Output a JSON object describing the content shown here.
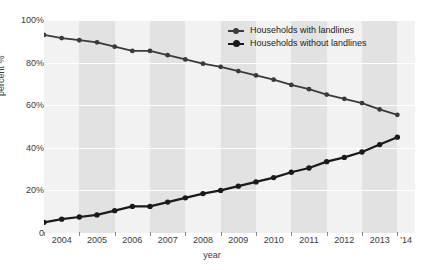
{
  "chart_data": {
    "type": "line",
    "title": "",
    "xlabel": "year",
    "ylabel": "percent %",
    "ylim": [
      0,
      100
    ],
    "xlim": [
      2004.0,
      2014.5
    ],
    "grid": true,
    "legend_position": "top-right",
    "y_ticks": [
      "0",
      "20%",
      "40%",
      "60%",
      "80%",
      "100%"
    ],
    "y_tick_values": [
      0,
      20,
      40,
      60,
      80,
      100
    ],
    "x_ticks": [
      "2004",
      "2005",
      "2006",
      "2007",
      "2008",
      "2009",
      "2010",
      "2011",
      "2012",
      "2013",
      "'14"
    ],
    "x_tick_values": [
      2004,
      2005,
      2006,
      2007,
      2008,
      2009,
      2010,
      2011,
      2012,
      2013,
      2014
    ],
    "x": [
      2004.0,
      2004.5,
      2005.0,
      2005.5,
      2006.0,
      2006.5,
      2007.0,
      2007.5,
      2008.0,
      2008.5,
      2009.0,
      2009.5,
      2010.0,
      2010.5,
      2011.0,
      2011.5,
      2012.0,
      2012.5,
      2013.0,
      2013.5,
      2014.0
    ],
    "series": [
      {
        "name": "Households with landlines",
        "color": "#3a3a3a",
        "values": [
          93.0,
          91.5,
          90.5,
          89.5,
          87.5,
          85.5,
          85.5,
          83.5,
          81.5,
          79.5,
          78.0,
          76.0,
          74.0,
          72.0,
          69.5,
          67.5,
          65.0,
          63.0,
          61.0,
          58.0,
          55.5
        ]
      },
      {
        "name": "Households without landlines",
        "color": "#1a1a1a",
        "values": [
          5.0,
          6.5,
          7.5,
          8.5,
          10.5,
          12.5,
          12.5,
          14.5,
          16.5,
          18.5,
          20.0,
          22.0,
          24.0,
          26.0,
          28.5,
          30.5,
          33.5,
          35.5,
          38.0,
          41.5,
          45.0
        ]
      }
    ]
  },
  "legend": {
    "items": [
      {
        "label": "Households with landlines"
      },
      {
        "label": "Households without landlines"
      }
    ]
  },
  "axes": {
    "y_title": "percent %",
    "x_title": "year"
  },
  "colors": {
    "plot_background": "#f2f2f2",
    "band": "#e2e2e2",
    "gridline": "#ffffff",
    "text": "#3b3b3b",
    "series_1": "#3a3a3a",
    "series_2": "#1a1a1a"
  }
}
